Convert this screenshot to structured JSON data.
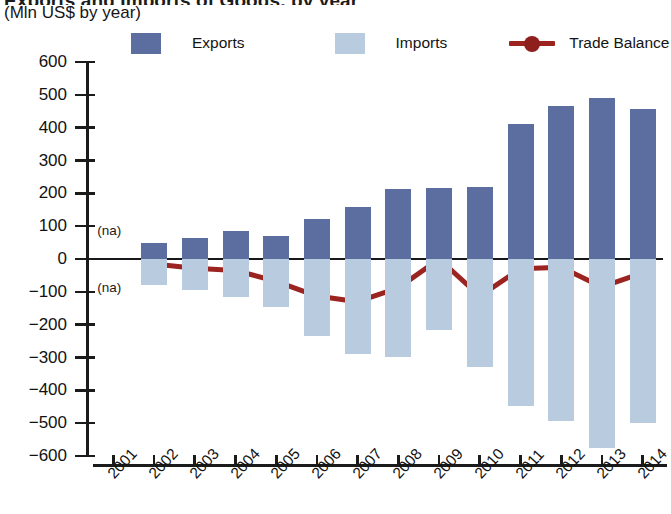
{
  "header": {
    "title_partial": "Exports and Imports of Goods, by year",
    "subtitle": "(Mln US$ by year)"
  },
  "legend": {
    "position": "top",
    "items": [
      {
        "label": "Exports",
        "color": "#5c6ea0",
        "marker": "square"
      },
      {
        "label": "Imports",
        "color": "#b8cbdf",
        "marker": "square"
      },
      {
        "label": "Trade Balance",
        "color": "#9c2420",
        "marker": "line-dot"
      }
    ]
  },
  "axes": {
    "y_ticks": [
      "600",
      "500",
      "400",
      "300",
      "200",
      "100",
      "0",
      "-100",
      "-200",
      "-300",
      "-400",
      "-500",
      "-600"
    ],
    "x_ticks": [
      "2001",
      "2002",
      "2003",
      "2004",
      "2005",
      "2006",
      "2007",
      "2008",
      "2009",
      "2010",
      "2011",
      "2012",
      "2013",
      "2014"
    ],
    "na_upper_label": "(na)",
    "na_lower_label": "(na)"
  },
  "colors": {
    "exports": "#5c6ea0",
    "imports": "#b8cbdf",
    "balance": "#9c2420",
    "axis": "#1b1b1b",
    "background": "#ffffff"
  },
  "chart_data": {
    "type": "bar",
    "title": "Exports and Imports of Goods, by year",
    "subtitle": "(Mln US$ by year)",
    "xlabel": "",
    "ylabel": "Mln US$",
    "ylim": [
      -600,
      600
    ],
    "ytick_step": 100,
    "grid": false,
    "legend_position": "top",
    "categories": [
      "2001",
      "2002",
      "2003",
      "2004",
      "2005",
      "2006",
      "2007",
      "2008",
      "2009",
      "2010",
      "2011",
      "2012",
      "2013",
      "2014"
    ],
    "series": [
      {
        "name": "Exports",
        "type": "bar",
        "color": "#5c6ea0",
        "values": [
          null,
          50,
          65,
          85,
          70,
          122,
          158,
          212,
          215,
          218,
          412,
          465,
          490,
          458
        ]
      },
      {
        "name": "Imports",
        "type": "bar",
        "color": "#b8cbdf",
        "values": [
          null,
          -80,
          -95,
          -115,
          -145,
          -235,
          -288,
          -298,
          -215,
          -330,
          -448,
          -492,
          -575,
          -500
        ]
      },
      {
        "name": "Trade Balance",
        "type": "line",
        "color": "#9c2420",
        "values": [
          null,
          -15,
          -28,
          -35,
          -68,
          -113,
          -130,
          -88,
          0,
          -113,
          -30,
          -25,
          -85,
          -42
        ]
      }
    ],
    "annotations": [
      {
        "text": "(na)",
        "x": "2001",
        "y": 85
      },
      {
        "text": "(na)",
        "x": "2001",
        "y": -90
      }
    ]
  }
}
